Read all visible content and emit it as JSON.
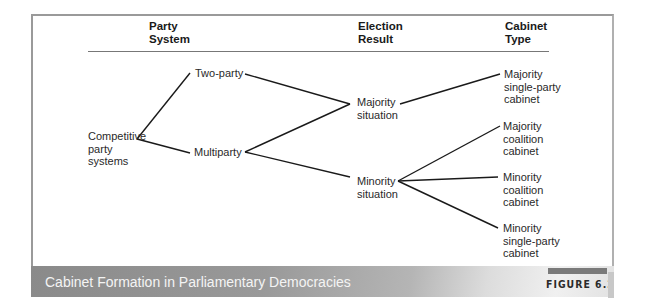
{
  "headers": {
    "party_system": [
      "Party",
      "System"
    ],
    "election_result": [
      "Election",
      "Result"
    ],
    "cabinet_type": [
      "Cabinet",
      "Type"
    ]
  },
  "nodes": {
    "root": [
      "Competitive",
      "party",
      "systems"
    ],
    "two_party": [
      "Two-party"
    ],
    "multiparty": [
      "Multiparty"
    ],
    "majority_situation": [
      "Majority",
      "situation"
    ],
    "minority_situation": [
      "Minority",
      "situation"
    ],
    "majority_single_party": [
      "Majority",
      "single-party",
      "cabinet"
    ],
    "majority_coalition": [
      "Majority",
      "coalition",
      "cabinet"
    ],
    "minority_coalition": [
      "Minority",
      "coalition",
      "cabinet"
    ],
    "minority_single_party": [
      "Minority",
      "single-party",
      "cabinet"
    ]
  },
  "edges": [
    [
      "root",
      "two_party"
    ],
    [
      "root",
      "multiparty"
    ],
    [
      "two_party",
      "majority_situation"
    ],
    [
      "multiparty",
      "majority_situation"
    ],
    [
      "multiparty",
      "minority_situation"
    ],
    [
      "majority_situation",
      "majority_single_party"
    ],
    [
      "minority_situation",
      "majority_coalition"
    ],
    [
      "minority_situation",
      "minority_coalition"
    ],
    [
      "minority_situation",
      "minority_single_party"
    ]
  ],
  "footer": {
    "title": "Cabinet Formation in Parliamentary Democracies",
    "figure_label": "FIGURE 6.2"
  }
}
